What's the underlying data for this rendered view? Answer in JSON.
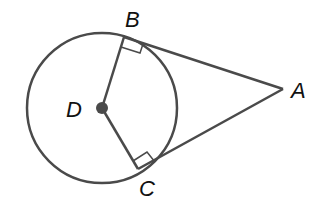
{
  "diagram": {
    "type": "geometry",
    "labels": {
      "A": "A",
      "B": "B",
      "C": "C",
      "D": "D"
    },
    "colors": {
      "stroke": "#4a4a4a",
      "label": "#111111",
      "background": "#ffffff"
    }
  }
}
